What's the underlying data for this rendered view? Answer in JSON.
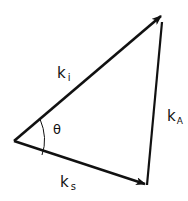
{
  "diagram": {
    "type": "vector-triangle",
    "stroke_color": "#111111",
    "background": "#ffffff",
    "vectors": [
      {
        "name": "k_i",
        "label": "k",
        "subscript": "i",
        "from": [
          14,
          141
        ],
        "to": [
          163,
          14
        ]
      },
      {
        "name": "k_s",
        "label": "k",
        "subscript": "s",
        "from": [
          14,
          141
        ],
        "to": [
          147,
          185
        ]
      },
      {
        "name": "k_A",
        "label": "k",
        "subscript": "A",
        "from": [
          147,
          185
        ],
        "to": [
          163,
          14
        ]
      }
    ],
    "angle": {
      "label": "θ",
      "between": [
        "k_i",
        "k_s"
      ]
    }
  }
}
